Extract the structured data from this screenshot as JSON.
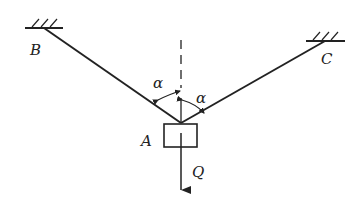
{
  "diagram": {
    "type": "statics-suspension",
    "labels": {
      "support_left": "B",
      "support_right": "C",
      "point": "A",
      "load": "Q",
      "angle_left": "α",
      "angle_right": "α"
    },
    "colors": {
      "stroke": "#222222",
      "background": "#ffffff"
    }
  }
}
